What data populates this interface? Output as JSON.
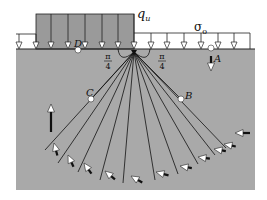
{
  "diagram": {
    "labels": {
      "footing_load": "q",
      "footing_load_sub": "u",
      "surcharge": "σ",
      "surcharge_sub": "o",
      "angle_left_num": "π",
      "angle_left_den": "4",
      "angle_right_num": "π",
      "angle_right_den": "4",
      "point_a": "A",
      "point_b": "B",
      "point_c": "C",
      "point_d": "D"
    },
    "colors": {
      "ground": "#a9a9a9",
      "footing_load_block": "#9a9a9a",
      "line": "#111111",
      "arrow_fill": "#ffffff",
      "arrow_tail": "#111111",
      "background": "#ffffff"
    },
    "fan": {
      "line_count": 12,
      "description": "Radial lines emanating from the footing edge"
    },
    "load_arrow_counts": {
      "footing": 7,
      "surcharge_right": 7,
      "surcharge_left": 2
    }
  }
}
